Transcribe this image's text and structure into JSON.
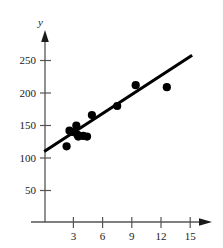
{
  "chart_data": {
    "type": "scatter",
    "title": "",
    "subtitle": "",
    "xlabel": "",
    "ylabel": "y",
    "xlim": [
      0,
      16.5
    ],
    "ylim": [
      0,
      275
    ],
    "grid": false,
    "legend": null,
    "x_ticks": [
      3,
      6,
      9,
      12,
      15
    ],
    "y_ticks": [
      50,
      100,
      150,
      200,
      250
    ],
    "x_tick_labels": [
      "3",
      "6",
      "9",
      "12",
      "15"
    ],
    "y_tick_labels": [
      "50",
      "100",
      "150",
      "200",
      "250"
    ],
    "axis_arrows": true,
    "marker": "filled-circle",
    "marker_color": "#000000",
    "line_color": "#000000",
    "axis_color": "#555555",
    "points": [
      {
        "x": 2.3,
        "y": 118
      },
      {
        "x": 2.6,
        "y": 142
      },
      {
        "x": 2.9,
        "y": 140
      },
      {
        "x": 3.3,
        "y": 150
      },
      {
        "x": 3.4,
        "y": 136
      },
      {
        "x": 3.5,
        "y": 133
      },
      {
        "x": 4.0,
        "y": 134
      },
      {
        "x": 4.4,
        "y": 133
      },
      {
        "x": 4.9,
        "y": 166
      },
      {
        "x": 7.5,
        "y": 180
      },
      {
        "x": 9.4,
        "y": 212
      },
      {
        "x": 12.6,
        "y": 209
      }
    ],
    "trendline": {
      "type": "linear",
      "x_start": 0.0,
      "y_start": 110,
      "x_end": 15.2,
      "y_end": 258,
      "slope": 9.74,
      "intercept": 110
    }
  }
}
